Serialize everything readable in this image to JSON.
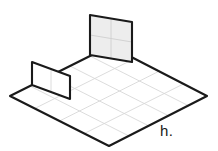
{
  "figure": {
    "label": "h.",
    "label_x": 160,
    "label_y": 122,
    "background_color": "#ffffff",
    "outline_color": "#1a1a1a",
    "grid_line_color": "#d8d8d8",
    "panel_fill_color": "#ededed",
    "floor_fill_color": "#ffffff",
    "outline_width": 2.1,
    "grid_line_width": 0.9
  },
  "floor": {
    "name": "isometric-floor-grid",
    "columns": 5,
    "rows": 4,
    "corner_left": [
      10,
      96
    ],
    "corner_top": [
      110,
      46
    ],
    "corner_right": [
      207,
      96
    ],
    "corner_bottom": [
      109,
      146
    ],
    "filled": false
  },
  "walls": [
    {
      "name": "back-wall-panel",
      "columns": 2,
      "rows": 2,
      "filled": true,
      "base_start": [
        90,
        55
      ],
      "base_end": [
        132,
        62
      ],
      "height": 40,
      "orientation": "rising-right"
    },
    {
      "name": "left-wall-panel",
      "columns": 2,
      "rows": 1,
      "filled": false,
      "base_start": [
        32,
        85
      ],
      "base_end": [
        70,
        99
      ],
      "height": 23,
      "orientation": "descending-right"
    }
  ],
  "chart_data": {
    "type": "diagram",
    "title": "h.",
    "floor_grid": {
      "columns": 5,
      "rows": 4
    },
    "panels": [
      {
        "id": "back",
        "columns": 2,
        "rows": 2,
        "shaded": true
      },
      {
        "id": "left",
        "columns": 2,
        "rows": 1,
        "shaded": false
      }
    ]
  }
}
